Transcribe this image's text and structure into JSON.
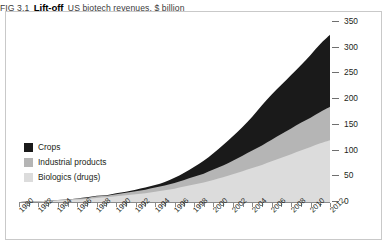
{
  "header": {
    "fig_number": "FIG 3.1",
    "title": "Lift-off",
    "subtitle": "US biotech revenues, $ billion"
  },
  "legend": {
    "position": "inside-left",
    "items": [
      {
        "label": "Crops",
        "color": "#1a1a1a",
        "swatch_name": "legend-swatch-crops"
      },
      {
        "label": "Industrial products",
        "color": "#b5b5b5",
        "swatch_name": "legend-swatch-industrial"
      },
      {
        "label": "Biologics (drugs)",
        "color": "#dcdcdc",
        "swatch_name": "legend-swatch-biologics"
      }
    ]
  },
  "axes": {
    "y": {
      "side": "right",
      "ticks": [
        0,
        50,
        100,
        150,
        200,
        250,
        300,
        350
      ],
      "min": 0,
      "max": 350
    },
    "x": {
      "min": 1980,
      "max": 2012,
      "label_step": 2,
      "tick_step": 1,
      "labels": [
        "1980",
        "1982",
        "1984",
        "1986",
        "1988",
        "1990",
        "1992",
        "1994",
        "1996",
        "1998",
        "2000",
        "2002",
        "2004",
        "2006",
        "2008",
        "2010",
        "2012"
      ]
    }
  },
  "chart_data": {
    "type": "area",
    "stacked": true,
    "title": "Lift-off",
    "subtitle": "US biotech revenues, $ billion",
    "xlabel": "",
    "ylabel": "$ billion",
    "ylim": [
      0,
      350
    ],
    "xlim": [
      1980,
      2012
    ],
    "grid": false,
    "legend_position": "inside-left",
    "x": [
      1980,
      1981,
      1982,
      1983,
      1984,
      1985,
      1986,
      1987,
      1988,
      1989,
      1990,
      1991,
      1992,
      1993,
      1994,
      1995,
      1996,
      1997,
      1998,
      1999,
      2000,
      2001,
      2002,
      2003,
      2004,
      2005,
      2006,
      2007,
      2008,
      2009,
      2010,
      2011,
      2012
    ],
    "series": [
      {
        "name": "Biologics (drugs)",
        "color": "#dcdcdc",
        "values": [
          0,
          1,
          1,
          2,
          3,
          4,
          5,
          6,
          8,
          9,
          11,
          13,
          15,
          17,
          20,
          23,
          26,
          30,
          34,
          38,
          43,
          48,
          54,
          60,
          66,
          72,
          79,
          86,
          93,
          100,
          107,
          114,
          120
        ]
      },
      {
        "name": "Industrial products",
        "color": "#b5b5b5",
        "values": [
          0,
          0,
          0,
          1,
          1,
          1,
          2,
          2,
          3,
          3,
          4,
          5,
          6,
          7,
          8,
          9,
          11,
          13,
          15,
          17,
          20,
          23,
          26,
          30,
          34,
          38,
          42,
          46,
          50,
          54,
          57,
          61,
          65
        ]
      },
      {
        "name": "Crops",
        "color": "#1a1a1a",
        "values": [
          0,
          0,
          0,
          0,
          0,
          0,
          0,
          1,
          1,
          1,
          2,
          2,
          3,
          4,
          5,
          7,
          10,
          14,
          19,
          25,
          32,
          40,
          48,
          56,
          66,
          78,
          88,
          96,
          104,
          112,
          122,
          132,
          140
        ]
      }
    ],
    "totals_2012": {
      "biologics": 120,
      "industrial": 65,
      "crops": 140,
      "total": 325
    }
  },
  "colors": {
    "frame": "#c9c9c9",
    "axis": "#8a8a8a",
    "text": "#231f20",
    "background": "#ffffff"
  }
}
